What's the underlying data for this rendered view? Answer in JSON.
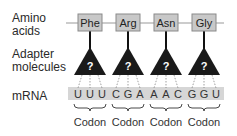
{
  "labels": {
    "amino_line1": "Amino",
    "amino_line2": "acids",
    "adapter_line1": "Adapter",
    "adapter_line2": "molecules",
    "mrna": "mRNA"
  },
  "amino_acids": [
    "Phe",
    "Arg",
    "Asn",
    "Gly"
  ],
  "adapter_symbol": "?",
  "codons": [
    {
      "bases": [
        "U",
        "U",
        "U"
      ],
      "label": "Codon"
    },
    {
      "bases": [
        "C",
        "G",
        "A"
      ],
      "label": "Codon"
    },
    {
      "bases": [
        "A",
        "A",
        "C"
      ],
      "label": "Codon"
    },
    {
      "bases": [
        "G",
        "G",
        "U"
      ],
      "label": "Codon"
    }
  ],
  "colors": {
    "box_fill": "#c8c8c8",
    "box_stroke": "#8a8a8a",
    "triangle": "#1a1a1a",
    "mrna_band": "#d6d6d6",
    "line": "#999999"
  }
}
